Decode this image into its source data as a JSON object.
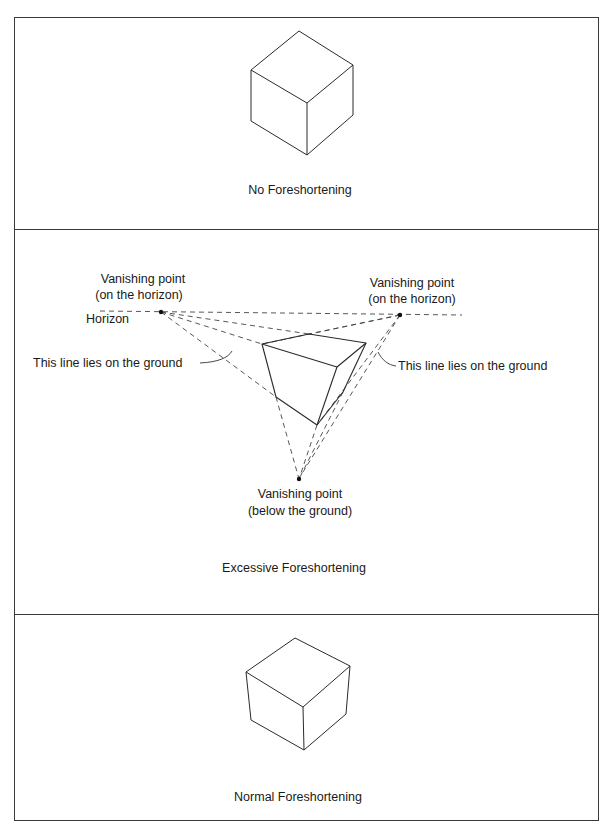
{
  "panels": [
    {
      "id": "no-foreshortening",
      "caption": "No Foreshortening"
    },
    {
      "id": "excessive-foreshortening",
      "caption": "Excessive Foreshortening",
      "annotations": {
        "vp_left_line1": "Vanishing point",
        "vp_left_line2": "(on the horizon)",
        "vp_right_line1": "Vanishing point",
        "vp_right_line2": "(on the horizon)",
        "horizon": "Horizon",
        "ground_left": "This line lies on the ground",
        "ground_right": "This line lies on the ground",
        "vp_bottom_line1": "Vanishing point",
        "vp_bottom_line2": "(below the ground)"
      }
    },
    {
      "id": "normal-foreshortening",
      "caption": "Normal Foreshortening"
    }
  ],
  "colors": {
    "stroke": "#2a2a2a",
    "border": "#3a3a3a",
    "background": "#ffffff"
  }
}
